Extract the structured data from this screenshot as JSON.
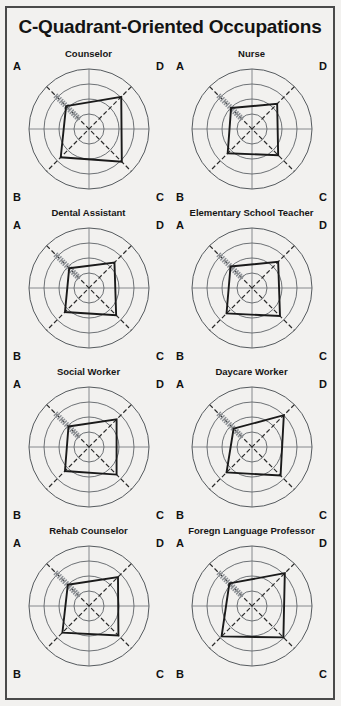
{
  "page": {
    "title": "C-Quadrant-Oriented Occupations",
    "background_color": "#f2f1ef",
    "border_color": "#4a4a4a",
    "title_color": "#141414"
  },
  "quadrant_labels": {
    "a": "A",
    "b": "B",
    "c": "C",
    "d": "D"
  },
  "chart_data": [
    {
      "type": "radar",
      "title": "Counselor",
      "categories": [
        "A",
        "D",
        "C",
        "B"
      ],
      "values": [
        1.62,
        2.28,
        2.32,
        2.0
      ],
      "rmax": 3.0,
      "grid": true,
      "rings": 3,
      "legend": "none",
      "axis_labels": [
        "A",
        "B",
        "C",
        "D"
      ],
      "series_color": "#1a1a1a"
    },
    {
      "type": "radar",
      "title": "Nurse",
      "categories": [
        "A",
        "D",
        "C",
        "B"
      ],
      "values": [
        1.48,
        1.78,
        1.85,
        1.72
      ],
      "rmax": 3.0,
      "grid": true,
      "rings": 3,
      "legend": "none",
      "axis_labels": [
        "A",
        "B",
        "C",
        "D"
      ],
      "series_color": "#1a1a1a"
    },
    {
      "type": "radar",
      "title": "Dental Assistant",
      "categories": [
        "A",
        "D",
        "C",
        "B"
      ],
      "values": [
        1.4,
        1.8,
        1.92,
        1.7
      ],
      "rmax": 3.0,
      "grid": true,
      "rings": 3,
      "legend": "none",
      "axis_labels": [
        "A",
        "B",
        "C",
        "D"
      ],
      "series_color": "#1a1a1a"
    },
    {
      "type": "radar",
      "title": "Elementary School Teacher",
      "categories": [
        "A",
        "D",
        "C",
        "B"
      ],
      "values": [
        1.52,
        1.85,
        1.98,
        1.8
      ],
      "rmax": 3.0,
      "grid": true,
      "rings": 3,
      "legend": "none",
      "axis_labels": [
        "A",
        "B",
        "C",
        "D"
      ],
      "series_color": "#1a1a1a"
    },
    {
      "type": "radar",
      "title": "Social Worker",
      "categories": [
        "A",
        "D",
        "C",
        "B"
      ],
      "values": [
        1.45,
        1.95,
        1.95,
        1.7
      ],
      "rmax": 3.0,
      "grid": true,
      "rings": 3,
      "legend": "none",
      "axis_labels": [
        "A",
        "B",
        "C",
        "D"
      ],
      "series_color": "#1a1a1a"
    },
    {
      "type": "radar",
      "title": "Daycare Worker",
      "categories": [
        "A",
        "D",
        "C",
        "B"
      ],
      "values": [
        1.3,
        2.25,
        2.02,
        1.8
      ],
      "rmax": 3.0,
      "grid": true,
      "rings": 3,
      "legend": "none",
      "axis_labels": [
        "A",
        "B",
        "C",
        "D"
      ],
      "series_color": "#1a1a1a"
    },
    {
      "type": "radar",
      "title": "Rehab Counselor",
      "categories": [
        "A",
        "D",
        "C",
        "B"
      ],
      "values": [
        1.5,
        2.05,
        2.08,
        1.88
      ],
      "rmax": 3.0,
      "grid": true,
      "rings": 3,
      "legend": "none",
      "axis_labels": [
        "A",
        "B",
        "C",
        "D"
      ],
      "series_color": "#1a1a1a"
    },
    {
      "type": "radar",
      "title": "Foregn Language Professor",
      "categories": [
        "A",
        "D",
        "C",
        "B"
      ],
      "values": [
        1.6,
        2.32,
        2.22,
        2.15
      ],
      "rmax": 3.0,
      "grid": true,
      "rings": 3,
      "legend": "none",
      "axis_labels": [
        "A",
        "B",
        "C",
        "D"
      ],
      "series_color": "#1a1a1a"
    }
  ]
}
